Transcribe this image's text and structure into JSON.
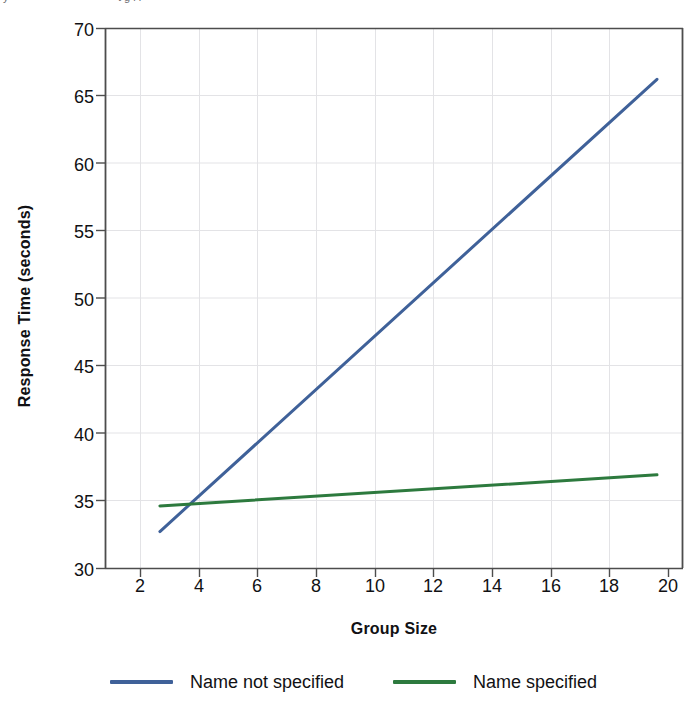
{
  "top_caption": {
    "fragment_left": "y",
    "fragment_right": "t g    l  i"
  },
  "chart_data": {
    "type": "line",
    "title": "",
    "subtitle": "",
    "xlabel": "Group Size",
    "ylabel": "Response Time (seconds)",
    "xlim": [
      0,
      20
    ],
    "ylim": [
      30,
      70
    ],
    "xticks": [
      2,
      4,
      6,
      8,
      10,
      12,
      14,
      16,
      18,
      20
    ],
    "xtick_labels": [
      "2",
      "4",
      "6",
      "8",
      "10",
      "12",
      "14",
      "16",
      "18",
      "20"
    ],
    "yticks": [
      30,
      35,
      40,
      45,
      50,
      55,
      60,
      65,
      70
    ],
    "ytick_labels": [
      "30",
      "35",
      "40",
      "45",
      "50",
      "55",
      "60",
      "65",
      "70"
    ],
    "grid": "horizontal-and-vertical-light",
    "legend_position": "below-axes",
    "series": [
      {
        "name": "Name not specified",
        "color": "#3f6199",
        "x": [
          1.9,
          19.1
        ],
        "values": [
          32.7,
          66.2
        ],
        "linewidth": 3
      },
      {
        "name": "Name specified",
        "color": "#2d7a3e",
        "x": [
          1.9,
          19.1
        ],
        "values": [
          34.6,
          36.9
        ],
        "linewidth": 3
      }
    ],
    "annotations": []
  },
  "legend": {
    "entries": [
      {
        "label": "Name not specified",
        "color": "#3f6199"
      },
      {
        "label": "Name specified",
        "color": "#2d7a3e"
      }
    ]
  },
  "axes_style": {
    "frame_color": "#4d4d4d",
    "gridline_color": "#e3e3e6",
    "background": "#ffffff"
  }
}
